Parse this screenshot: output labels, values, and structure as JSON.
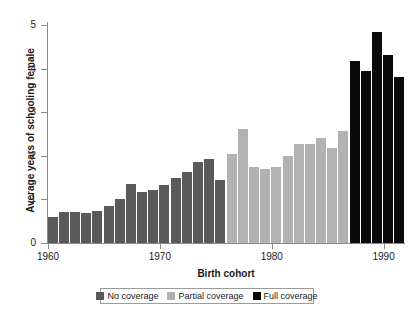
{
  "chart_data": {
    "type": "bar",
    "title": "",
    "xlabel": "Birth cohort",
    "ylabel": "Average years of schooling female",
    "xlim": [
      1960,
      1992
    ],
    "ylim": [
      0,
      5
    ],
    "yticks": [
      0,
      1,
      2,
      3,
      4,
      5
    ],
    "xticks": [
      1960,
      1970,
      1980,
      1990
    ],
    "grid": false,
    "legend_position": "bottom",
    "categories": [
      1960,
      1961,
      1962,
      1963,
      1964,
      1965,
      1966,
      1967,
      1968,
      1969,
      1970,
      1971,
      1972,
      1973,
      1974,
      1975,
      1976,
      1977,
      1978,
      1979,
      1980,
      1981,
      1982,
      1983,
      1984,
      1985,
      1986,
      1987,
      1988,
      1989,
      1990,
      1991
    ],
    "values": [
      0.6,
      0.72,
      0.72,
      0.68,
      0.74,
      0.86,
      1.0,
      1.36,
      1.18,
      1.22,
      1.33,
      1.5,
      1.62,
      1.85,
      1.93,
      1.44,
      2.04,
      2.62,
      1.74,
      1.7,
      1.74,
      2.0,
      2.28,
      2.28,
      2.42,
      2.18,
      2.56,
      4.18,
      3.95,
      4.85,
      4.32,
      3.8
    ],
    "groups": [
      {
        "name": "No coverage",
        "color": "#5a5a5a",
        "range": [
          1960,
          1975
        ]
      },
      {
        "name": "Partial coverage",
        "color": "#b2b2b2",
        "range": [
          1976,
          1986
        ]
      },
      {
        "name": "Full coverage",
        "color": "#0a0a0a",
        "range": [
          1987,
          1991
        ]
      }
    ],
    "series": [
      {
        "name": "Average years of schooling female",
        "values": [
          0.6,
          0.72,
          0.72,
          0.68,
          0.74,
          0.86,
          1.0,
          1.36,
          1.18,
          1.22,
          1.33,
          1.5,
          1.62,
          1.85,
          1.93,
          1.44,
          2.04,
          2.62,
          1.74,
          1.7,
          1.74,
          2.0,
          2.28,
          2.28,
          2.42,
          2.18,
          2.56,
          4.18,
          3.95,
          4.85,
          4.32,
          3.8
        ]
      }
    ]
  },
  "axes": {
    "ylabel": "Average years of schooling female",
    "xlabel": "Birth cohort",
    "ytick_labels": [
      "0",
      "1",
      "2",
      "3",
      "4",
      "5"
    ],
    "xtick_labels": [
      "1960",
      "1970",
      "1980",
      "1990"
    ]
  },
  "legend": {
    "items": [
      {
        "label": "No coverage",
        "color": "#5a5a5a"
      },
      {
        "label": "Partial coverage",
        "color": "#b2b2b2"
      },
      {
        "label": "Full coverage",
        "color": "#0a0a0a"
      }
    ]
  },
  "colors": {
    "no_coverage": "#5a5a5a",
    "partial_coverage": "#b2b2b2",
    "full_coverage": "#0a0a0a",
    "axis": "#8a8a8a",
    "background": "#ffffff"
  }
}
